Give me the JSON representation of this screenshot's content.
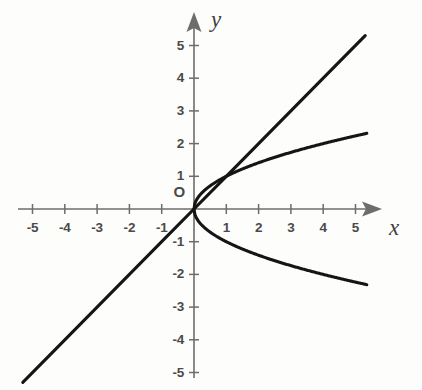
{
  "figure": {
    "background_color": "#fdfdfc",
    "axis_color": "#6d6d6d",
    "curve_color": "#151515",
    "label_color": "#4a4a4a",
    "origin_label": "O",
    "x_axis_name": "x",
    "y_axis_name": "y"
  },
  "chart_data": {
    "type": "line",
    "title": "",
    "subtitle": "",
    "xlabel": "x",
    "ylabel": "y",
    "xlim": [
      -5.6,
      5.8
    ],
    "ylim": [
      -5.5,
      5.6
    ],
    "grid": false,
    "legend": "none",
    "origin_label": "O",
    "x_ticks": [
      -5,
      -4,
      -3,
      -2,
      -1,
      1,
      2,
      3,
      4,
      5
    ],
    "y_ticks": [
      -5,
      -4,
      -3,
      -2,
      -1,
      1,
      2,
      3,
      4,
      5
    ],
    "x_tick_labels": [
      "-5",
      "-4",
      "-3",
      "-2",
      "-1",
      "1",
      "2",
      "3",
      "4",
      "5"
    ],
    "y_tick_labels": [
      "-5",
      "-4",
      "-3",
      "-2",
      "-1",
      "1",
      "2",
      "3",
      "4",
      "5"
    ],
    "annotations": [
      {
        "text": "O",
        "x": -0.45,
        "y": 0.55,
        "note": "origin label"
      },
      {
        "text": "x",
        "x": 5.95,
        "y": -0.55,
        "note": "x-axis name, italic"
      },
      {
        "text": "y",
        "x": 0.75,
        "y": 5.6,
        "note": "y-axis name, italic"
      }
    ],
    "series": [
      {
        "name": "y = x",
        "equation": "y = x",
        "style": "solid",
        "x": [
          -5.3,
          -4,
          -3,
          -2,
          -1,
          0,
          1,
          2,
          3,
          4,
          5.3
        ],
        "values": [
          -5.3,
          -4,
          -3,
          -2,
          -1,
          0,
          1,
          2,
          3,
          4,
          5.3
        ]
      },
      {
        "name": "y = sqrt(x)",
        "equation": "y = √x",
        "style": "solid",
        "x": [
          0,
          0.25,
          0.5,
          1,
          1.5,
          2,
          2.5,
          3,
          3.5,
          4,
          4.5,
          5,
          5.35
        ],
        "values": [
          0,
          0.5,
          0.707,
          1,
          1.225,
          1.414,
          1.581,
          1.732,
          1.871,
          2,
          2.121,
          2.236,
          2.313
        ]
      },
      {
        "name": "y = -sqrt(x)",
        "equation": "y = -√x",
        "style": "solid",
        "x": [
          0,
          0.25,
          0.5,
          1,
          1.5,
          2,
          2.5,
          3,
          3.5,
          4,
          4.5,
          5,
          5.35
        ],
        "values": [
          0,
          -0.5,
          -0.707,
          -1,
          -1.225,
          -1.414,
          -1.581,
          -1.732,
          -1.871,
          -2,
          -2.121,
          -2.236,
          -2.313
        ]
      }
    ],
    "intersections": [
      {
        "x": 0,
        "y": 0,
        "note": "all three curves meet at origin"
      },
      {
        "x": 1,
        "y": 1,
        "note": "y = x meets y = sqrt(x)"
      }
    ]
  }
}
